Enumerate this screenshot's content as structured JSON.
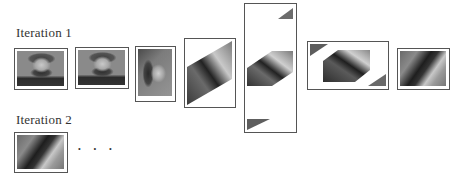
{
  "figure": {
    "rows": [
      {
        "label": "Iteration 1",
        "steps": [
          {
            "name": "original",
            "desc": "original portrait image"
          },
          {
            "name": "copy",
            "desc": "portrait image copy"
          },
          {
            "name": "rotated",
            "desc": "rotated/transposed portrait"
          },
          {
            "name": "sheared-vertical",
            "desc": "vertically sheared image in tall frame"
          },
          {
            "name": "wrapped-vertical",
            "desc": "sheared image with wrapped corner pieces in tall frame"
          },
          {
            "name": "sheared-horizontal",
            "desc": "horizontally sheared image with wrapped corners in wide frame"
          },
          {
            "name": "cropped-result",
            "desc": "cropped result image"
          }
        ]
      },
      {
        "label": "Iteration 2",
        "steps": [
          {
            "name": "iteration-2-input",
            "desc": "result from iteration 1"
          }
        ],
        "continuation": "· · ·"
      }
    ]
  },
  "colors": {
    "frame_border": "#555555",
    "text": "#333333",
    "background": "#ffffff"
  }
}
